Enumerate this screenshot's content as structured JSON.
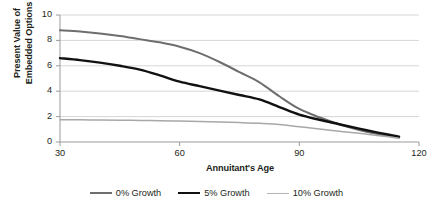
{
  "chart_data": {
    "type": "line",
    "title": "",
    "xlabel": "Annuitant's Age",
    "ylabel": "Present Value of Embedded Options",
    "ylabel_line1": "Present Value of",
    "ylabel_line2": "Embedded Options",
    "xlim": [
      30,
      120
    ],
    "ylim": [
      0,
      10
    ],
    "xticks": [
      30,
      60,
      90,
      120
    ],
    "yticks": [
      0,
      2,
      4,
      6,
      8,
      10
    ],
    "xtick_labels": [
      "30",
      "60",
      "90",
      "120"
    ],
    "ytick_labels": [
      "0",
      "2",
      "4",
      "6",
      "8",
      "10"
    ],
    "grid": "horizontal",
    "legend_position": "bottom",
    "x": [
      30,
      35,
      40,
      45,
      50,
      55,
      60,
      65,
      70,
      75,
      80,
      85,
      90,
      95,
      100,
      105,
      110,
      115
    ],
    "series": [
      {
        "name": "0% Growth",
        "color": "#6e6e6e",
        "width": 2.0,
        "values": [
          8.8,
          8.7,
          8.55,
          8.35,
          8.1,
          7.85,
          7.5,
          7.0,
          6.3,
          5.5,
          4.7,
          3.6,
          2.6,
          1.95,
          1.4,
          0.95,
          0.6,
          0.35
        ]
      },
      {
        "name": "5% Growth",
        "color": "#111111",
        "width": 2.4,
        "values": [
          6.6,
          6.45,
          6.25,
          6.0,
          5.7,
          5.25,
          4.75,
          4.4,
          4.05,
          3.7,
          3.35,
          2.75,
          2.15,
          1.75,
          1.4,
          1.05,
          0.72,
          0.42
        ]
      },
      {
        "name": "10% Growth",
        "color": "#a8a8a8",
        "width": 1.5,
        "values": [
          1.75,
          1.75,
          1.73,
          1.72,
          1.7,
          1.68,
          1.65,
          1.62,
          1.58,
          1.53,
          1.47,
          1.38,
          1.2,
          1.02,
          0.85,
          0.68,
          0.5,
          0.3
        ]
      }
    ],
    "legend": [
      {
        "label": "0% Growth",
        "color": "#6e6e6e",
        "width": 2.0
      },
      {
        "label": "5% Growth",
        "color": "#111111",
        "width": 2.8
      },
      {
        "label": "10% Growth",
        "color": "#b4b4b4",
        "width": 1.4
      }
    ],
    "axis_color": "#9a9a9a",
    "grid_color": "#d6d6d6",
    "text_color": "#231f20"
  }
}
